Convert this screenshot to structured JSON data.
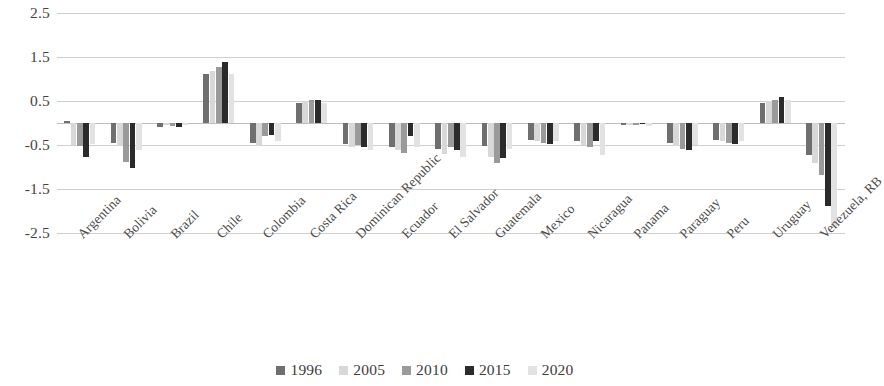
{
  "chart_data": {
    "type": "bar",
    "title": "",
    "subtitle": "",
    "xlabel": "",
    "ylabel": "",
    "ylim": [
      -2.5,
      2.5
    ],
    "ytick_labels": [
      "2.5",
      "1.5",
      "0.5",
      "-0.5",
      "-1.5",
      "-2.5"
    ],
    "ytick_values": [
      2.5,
      1.5,
      0.5,
      -0.5,
      -1.5,
      -2.5
    ],
    "grid": true,
    "legend_position": "bottom",
    "orientation": "vertical",
    "grouping": "clustered",
    "categories": [
      "Argentina",
      "Bolivia",
      "Brazil",
      "Chile",
      "Colombia",
      "Costa Rica",
      "Dominican Republic",
      "Ecuador",
      "El Salvador",
      "Guatemala",
      "Mexico",
      "Nicaragua",
      "Panama",
      "Paraguay",
      "Peru",
      "Uruguay",
      "Venezuela, RB"
    ],
    "series": [
      {
        "name": "1996",
        "color": "#6f6f6f",
        "values": [
          0.05,
          -0.45,
          -0.1,
          1.12,
          -0.45,
          0.45,
          -0.47,
          -0.55,
          -0.6,
          -0.52,
          -0.38,
          -0.42,
          -0.05,
          -0.45,
          -0.38,
          0.45,
          -0.72
        ]
      },
      {
        "name": "2005",
        "color": "#d8d8d8",
        "values": [
          -0.5,
          -0.52,
          -0.05,
          1.18,
          -0.52,
          0.5,
          -0.55,
          -0.62,
          -0.7,
          -0.78,
          -0.42,
          -0.5,
          -0.04,
          -0.52,
          -0.42,
          0.5,
          -0.9
        ]
      },
      {
        "name": "2010",
        "color": "#9a9a9a",
        "values": [
          -0.52,
          -0.88,
          -0.06,
          1.28,
          -0.3,
          0.52,
          -0.5,
          -0.68,
          -0.55,
          -0.92,
          -0.45,
          -0.55,
          -0.05,
          -0.58,
          -0.45,
          0.52,
          -1.18
        ]
      },
      {
        "name": "2015",
        "color": "#2b2b2b",
        "values": [
          -0.78,
          -1.02,
          -0.08,
          1.38,
          -0.28,
          0.52,
          -0.55,
          -0.3,
          -0.62,
          -0.8,
          -0.48,
          -0.42,
          -0.03,
          -0.62,
          -0.48,
          0.58,
          -1.88
        ]
      },
      {
        "name": "2020",
        "color": "#e2e2e2",
        "values": [
          -0.48,
          -0.62,
          -0.05,
          1.12,
          -0.42,
          0.45,
          -0.62,
          -0.55,
          -0.78,
          -0.6,
          -0.4,
          -0.72,
          -0.06,
          -0.5,
          -0.4,
          0.52,
          -2.38
        ]
      }
    ]
  },
  "legend": {
    "items": [
      {
        "label": "1996",
        "color": "#6f6f6f"
      },
      {
        "label": "2005",
        "color": "#d8d8d8"
      },
      {
        "label": "2010",
        "color": "#9a9a9a"
      },
      {
        "label": "2015",
        "color": "#2b2b2b"
      },
      {
        "label": "2020",
        "color": "#e2e2e2"
      }
    ]
  }
}
